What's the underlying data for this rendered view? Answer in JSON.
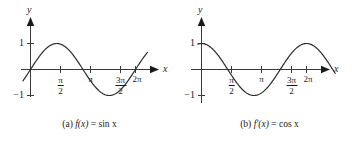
{
  "figure": {
    "panels": [
      {
        "id": "a",
        "caption_label": "(a)",
        "caption_fn": "f(x)",
        "caption_eq": "=",
        "caption_expr": "sin x",
        "caption_full": "(a) f(x) = sin x",
        "y_axis_label": "y",
        "x_axis_label": "x",
        "y_tick_top": "1",
        "y_tick_bottom": "−1",
        "x_tick_labels": [
          {
            "num": "π",
            "den": "2"
          },
          {
            "num": "π",
            "den": ""
          },
          {
            "num": "3π",
            "den": "2"
          },
          {
            "num": "2π",
            "den": ""
          }
        ]
      },
      {
        "id": "b",
        "caption_label": "(b)",
        "caption_fn": "f′(x)",
        "caption_eq": "=",
        "caption_expr": "cos x",
        "caption_full": "(b) f′(x) = cos x",
        "y_axis_label": "y",
        "x_axis_label": "x",
        "y_tick_top": "1",
        "y_tick_bottom": "−1",
        "x_tick_labels": [
          {
            "num": "π",
            "den": "2"
          },
          {
            "num": "π",
            "den": ""
          },
          {
            "num": "3π",
            "den": "2"
          },
          {
            "num": "2π",
            "den": ""
          }
        ]
      }
    ]
  },
  "chart_data": [
    {
      "type": "line",
      "title": "(a) f(x) = sin x",
      "function": "sin(x)",
      "xlabel": "x",
      "ylabel": "y",
      "xlim": [
        -0.45,
        7.2
      ],
      "ylim": [
        -1.35,
        1.35
      ],
      "grid": false,
      "legend": "none",
      "xticks": [
        1.5707963,
        3.1415927,
        4.712389,
        6.2831853
      ],
      "xticklabels": [
        "π/2",
        "π",
        "3π/2",
        "2π"
      ],
      "yticks": [
        1,
        -1
      ],
      "yticklabels": [
        "1",
        "−1"
      ],
      "x": [
        -0.45,
        0,
        0.3927,
        0.7854,
        1.1781,
        1.5708,
        1.9635,
        2.3562,
        2.7489,
        3.1416,
        3.5343,
        3.927,
        4.3197,
        4.7124,
        5.1051,
        5.4978,
        5.8905,
        6.2832,
        6.675,
        6.95
      ],
      "values": [
        -0.435,
        0,
        0.3827,
        0.7071,
        0.9239,
        1.0,
        0.9239,
        0.7071,
        0.3827,
        0,
        -0.3827,
        -0.7071,
        -0.9239,
        -1.0,
        -0.9239,
        -0.7071,
        -0.3827,
        0,
        0.3746,
        0.6119
      ]
    },
    {
      "type": "line",
      "title": "(b) f′(x) = cos x",
      "function": "cos(x)",
      "xlabel": "x",
      "ylabel": "y",
      "xlim": [
        -0.45,
        7.2
      ],
      "ylim": [
        -1.35,
        1.35
      ],
      "grid": false,
      "legend": "none",
      "xticks": [
        1.5707963,
        3.1415927,
        4.712389,
        6.2831853
      ],
      "xticklabels": [
        "π/2",
        "π",
        "3π/2",
        "2π"
      ],
      "yticks": [
        1,
        -1
      ],
      "yticklabels": [
        "1",
        "−1"
      ],
      "x": [
        -0.22,
        0,
        0.3927,
        0.7854,
        1.1781,
        1.5708,
        1.9635,
        2.3562,
        2.7489,
        3.1416,
        3.5343,
        3.927,
        4.3197,
        4.7124,
        5.1051,
        5.4978,
        5.8905,
        6.2832,
        6.675,
        6.95
      ],
      "values": [
        0.9756,
        1.0,
        0.9239,
        0.7071,
        0.3827,
        0,
        -0.3827,
        -0.7071,
        -0.9239,
        -1.0,
        -0.9239,
        -0.7071,
        -0.3827,
        0,
        0.3827,
        0.7071,
        0.9239,
        1.0,
        0.9307,
        0.8011
      ]
    }
  ]
}
